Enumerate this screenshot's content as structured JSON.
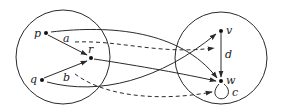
{
  "diagram": {
    "type": "graph",
    "colors": {
      "stroke": "#2a2a2a",
      "background": "#ffffff"
    },
    "regions": [
      {
        "id": "left-circle",
        "cx": 63,
        "cy": 57,
        "r": 47
      },
      {
        "id": "right-circle",
        "cx": 221,
        "cy": 58,
        "r": 46
      }
    ],
    "nodes": [
      {
        "id": "p",
        "label": "p",
        "x": 46,
        "y": 33
      },
      {
        "id": "q",
        "label": "q",
        "x": 42,
        "y": 80
      },
      {
        "id": "r",
        "label": "r",
        "x": 91,
        "y": 58
      },
      {
        "id": "v",
        "label": "v",
        "x": 221,
        "y": 31
      },
      {
        "id": "w",
        "label": "w",
        "x": 221,
        "y": 81
      }
    ],
    "edge_labels": {
      "a": "a",
      "b": "b",
      "c": "c",
      "d": "d"
    },
    "edges": [
      {
        "from": "p",
        "to": "r",
        "style": "solid"
      },
      {
        "from": "q",
        "to": "r",
        "style": "solid"
      },
      {
        "from": "p",
        "to": "w",
        "style": "solid"
      },
      {
        "from": "r",
        "to": "w",
        "style": "solid"
      },
      {
        "from": "q",
        "to": "v",
        "style": "solid"
      },
      {
        "from": "a",
        "to": "v",
        "style": "dashed",
        "label": "a"
      },
      {
        "from": "b",
        "to": "c",
        "style": "dashed",
        "label": "b"
      },
      {
        "from": "v",
        "to": "w",
        "style": "solid",
        "label": "d"
      },
      {
        "from": "w",
        "to": "w",
        "style": "solid",
        "label": "c"
      }
    ]
  }
}
